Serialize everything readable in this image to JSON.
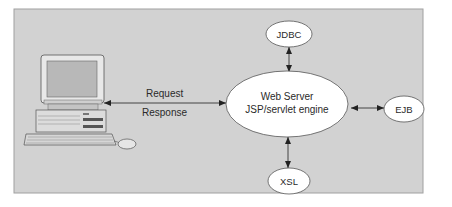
{
  "diagram": {
    "background_color": "#d2d2d2",
    "panel_border_color": "#9a9a9a",
    "node_fill": "#ffffff",
    "line_color": "#333333",
    "client": {
      "icon": "desktop-computer-icon"
    },
    "connection": {
      "request_label": "Request",
      "response_label": "Response"
    },
    "nodes": {
      "server": {
        "line1": "Web Server",
        "line2": "JSP/servlet engine"
      },
      "jdbc": {
        "label": "JDBC"
      },
      "ejb": {
        "label": "EJB"
      },
      "xsl": {
        "label": "XSL"
      }
    }
  }
}
